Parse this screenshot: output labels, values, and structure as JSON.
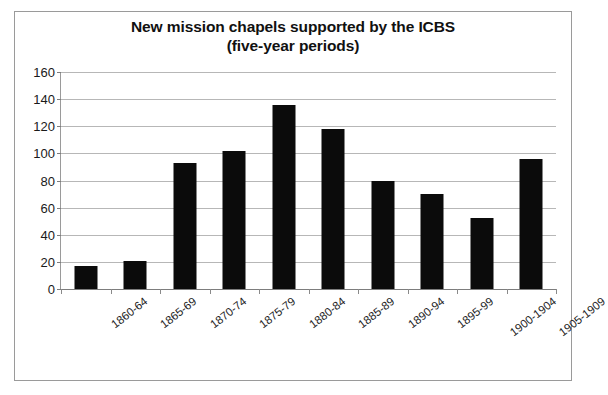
{
  "chart_data": {
    "type": "bar",
    "title": "New mission chapels supported by the ICBS (five-year periods)",
    "title_lines": [
      "New mission chapels supported by the ICBS",
      "(five-year periods)"
    ],
    "xlabel": "",
    "ylabel": "",
    "categories": [
      "1860-64",
      "1865-69",
      "1870-74",
      "1875-79",
      "1880-84",
      "1885-89",
      "1890-94",
      "1895-99",
      "1900-1904",
      "1905-1909"
    ],
    "values": [
      17,
      21,
      93,
      102,
      136,
      118,
      80,
      70,
      52,
      96
    ],
    "ylim": [
      0,
      160
    ],
    "yticks": [
      0,
      20,
      40,
      60,
      80,
      100,
      120,
      140,
      160
    ],
    "ytick_labels": [
      "0",
      "20",
      "40",
      "60",
      "80",
      "100",
      "120",
      "140",
      "160"
    ],
    "grid": true,
    "legend": false,
    "bar_color": "#0b0b0b",
    "gridline_color": "#b7b7b7",
    "background_color": "#ffffff",
    "border_color": "#9a9a9a",
    "series": [
      {
        "name": "New mission chapels",
        "values": [
          17,
          21,
          93,
          102,
          136,
          118,
          80,
          70,
          52,
          96
        ]
      }
    ]
  }
}
